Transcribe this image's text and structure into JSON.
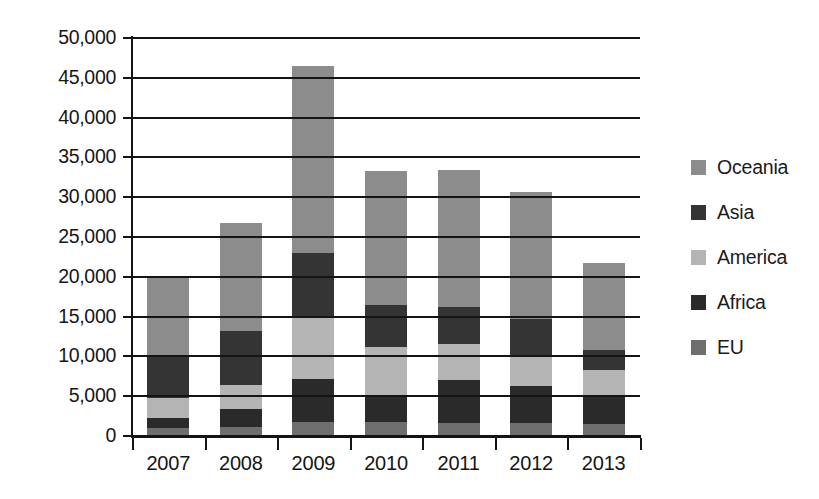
{
  "chart_data": {
    "type": "bar",
    "subtype": "stacked-vertical",
    "title": "",
    "xlabel": "",
    "ylabel": "",
    "categories": [
      "2007",
      "2008",
      "2009",
      "2010",
      "2011",
      "2012",
      "2013"
    ],
    "series": [
      {
        "name": "EU",
        "color": "#6e6e6e",
        "values": [
          1000,
          1100,
          1800,
          1700,
          1600,
          1600,
          1500
        ]
      },
      {
        "name": "Africa",
        "color": "#2a2a2a",
        "values": [
          1200,
          2300,
          5400,
          3300,
          5400,
          4700,
          3500
        ]
      },
      {
        "name": "America",
        "color": "#b4b4b4",
        "values": [
          2600,
          3000,
          7800,
          6200,
          4500,
          3700,
          3300
        ]
      },
      {
        "name": "Asia",
        "color": "#343434",
        "values": [
          5200,
          6800,
          8000,
          5300,
          4700,
          4700,
          2500
        ]
      },
      {
        "name": "Oceania",
        "color": "#8c8c8c",
        "values": [
          9800,
          13500,
          23500,
          16800,
          17200,
          15900,
          10900
        ]
      }
    ],
    "stack_order_bottom_to_top": [
      "EU",
      "Africa",
      "America",
      "Asia",
      "Oceania"
    ],
    "totals": [
      19800,
      26700,
      46500,
      33300,
      33400,
      30600,
      21700
    ],
    "cumulative_tops": {
      "2007": {
        "EU": 1000,
        "Africa": 2200,
        "America": 4800,
        "Asia": 10000,
        "Oceania": 19800
      },
      "2008": {
        "EU": 1100,
        "Africa": 3400,
        "America": 6400,
        "Asia": 13200,
        "Oceania": 26700
      },
      "2009": {
        "EU": 1800,
        "Africa": 7200,
        "America": 15000,
        "Asia": 23000,
        "Oceania": 46500
      },
      "2010": {
        "EU": 1700,
        "Africa": 5000,
        "America": 11200,
        "Asia": 16500,
        "Oceania": 33300
      },
      "2011": {
        "EU": 1600,
        "Africa": 7000,
        "America": 11500,
        "Asia": 16200,
        "Oceania": 33400
      },
      "2012": {
        "EU": 1600,
        "Africa": 6300,
        "America": 10000,
        "Asia": 14700,
        "Oceania": 30600
      },
      "2013": {
        "EU": 1500,
        "Africa": 5000,
        "America": 8300,
        "Asia": 10800,
        "Oceania": 21700
      }
    },
    "ylim": [
      0,
      50000
    ],
    "ytick_step": 5000,
    "ytick_labels": [
      "50,000",
      "45,000",
      "40,000",
      "35,000",
      "30,000",
      "25,000",
      "20,000",
      "15,000",
      "10,000",
      "5,000",
      "0"
    ],
    "ytick_values": [
      50000,
      45000,
      40000,
      35000,
      30000,
      25000,
      20000,
      15000,
      10000,
      5000,
      0
    ],
    "grid": true,
    "grid_axis": "y",
    "legend_position": "right",
    "legend_entries": [
      {
        "label": "Oceania",
        "color": "#8c8c8c"
      },
      {
        "label": "Asia",
        "color": "#343434"
      },
      {
        "label": "America",
        "color": "#b4b4b4"
      },
      {
        "label": "Africa",
        "color": "#2a2a2a"
      },
      {
        "label": "EU",
        "color": "#6e6e6e"
      }
    ]
  }
}
